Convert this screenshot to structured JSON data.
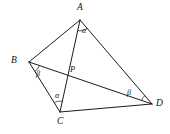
{
  "figure": {
    "type": "geometry-diagram",
    "background_color": "#ffffff",
    "line_color": "#1c1c1c",
    "width": 170,
    "height": 134,
    "vertices": [
      {
        "id": "A",
        "label": "A",
        "x": 80,
        "y": 20,
        "label_x": 77,
        "label_y": 3
      },
      {
        "id": "B",
        "label": "B",
        "x": 29,
        "y": 62,
        "label_x": 11,
        "label_y": 56
      },
      {
        "id": "C",
        "label": "C",
        "x": 60,
        "y": 112,
        "label_x": 57,
        "label_y": 117
      },
      {
        "id": "D",
        "label": "D",
        "x": 152,
        "y": 104,
        "label_x": 156,
        "label_y": 99
      },
      {
        "id": "P",
        "label": "P",
        "x": 68,
        "y": 73,
        "label_x": 70,
        "label_y": 65
      }
    ],
    "segments": [
      {
        "id": "AB",
        "from": "A",
        "to": "B"
      },
      {
        "id": "AD",
        "from": "A",
        "to": "D"
      },
      {
        "id": "AC",
        "from": "A",
        "to": "C"
      },
      {
        "id": "BC",
        "from": "B",
        "to": "C"
      },
      {
        "id": "BD",
        "from": "B",
        "to": "D"
      },
      {
        "id": "CD",
        "from": "C",
        "to": "D"
      }
    ],
    "angles": [
      {
        "id": "angle-A",
        "symbol": "α",
        "at": "A",
        "between": [
          "AC",
          "AD"
        ],
        "label_x": 82,
        "label_y": 27
      },
      {
        "id": "angle-B",
        "symbol": "β",
        "at": "B",
        "between": [
          "BC",
          "BD"
        ],
        "label_x": 36,
        "label_y": 70
      },
      {
        "id": "angle-C",
        "symbol": "α",
        "at": "C",
        "between": [
          "CB",
          "CA"
        ],
        "label_x": 55,
        "label_y": 92
      },
      {
        "id": "angle-D",
        "symbol": "β",
        "at": "D",
        "between": [
          "DB",
          "DA"
        ],
        "label_x": 127,
        "label_y": 89
      }
    ]
  }
}
